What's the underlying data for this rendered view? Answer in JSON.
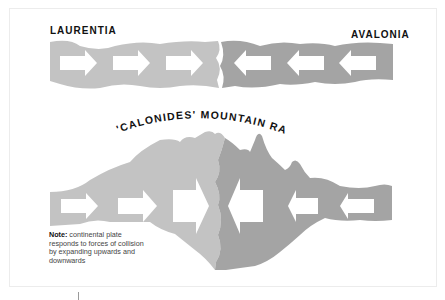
{
  "labels": {
    "left_plate": "LAURENTIA",
    "right_plate": "AVALONIA",
    "mountain_range": "'CALONIDES' MOUNTAIN RANGE"
  },
  "note": {
    "heading": "Note:",
    "text": " continental plate responds to forces of collision by expanding upwards and downwards"
  },
  "colors": {
    "laurentia_plate": "#c3c3c3",
    "avalonia_plate": "#a4a4a4",
    "arrow": "#ffffff",
    "text": "#111111"
  },
  "diagram": {
    "top_stage": {
      "left_arrows": 3,
      "right_arrows": 3,
      "arrow_direction_left_plate": "right",
      "arrow_direction_right_plate": "left"
    },
    "bottom_stage": {
      "left_arrows": 3,
      "right_arrows": 3
    }
  }
}
